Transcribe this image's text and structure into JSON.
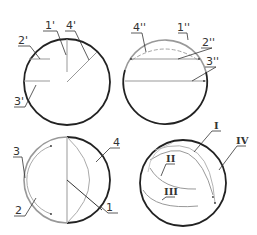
{
  "diagram": {
    "type": "sphere-section-projections",
    "colors": {
      "outline_dark": "#222222",
      "outline_gray": "#999999",
      "leader": "#333333",
      "text": "#333333"
    },
    "panels": [
      {
        "id": "top-left",
        "view": "side projection",
        "labels": [
          "1'",
          "2'",
          "3'",
          "4'"
        ]
      },
      {
        "id": "top-right",
        "view": "front projection",
        "labels": [
          "1''",
          "2''",
          "3''",
          "4''"
        ]
      },
      {
        "id": "bottom-left",
        "view": "top projection",
        "labels": [
          "1",
          "2",
          "3",
          "4"
        ]
      },
      {
        "id": "bottom-right",
        "view": "sphere isometric",
        "labels": [
          "I",
          "II",
          "III",
          "IV"
        ]
      }
    ]
  }
}
